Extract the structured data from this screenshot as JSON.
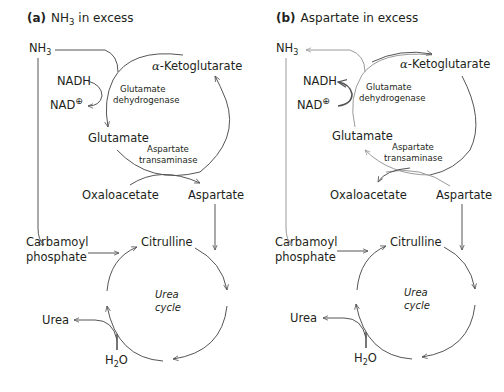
{
  "panels": [
    {
      "id": "a",
      "label": "(a)",
      "title": "NH",
      "title_sub": "3",
      "title_rest": " in excess",
      "nodes": {
        "nh3": "NH",
        "nh3_sub": "3",
        "nadh": "NADH",
        "nad": "NAD",
        "nad_sup": "⊕",
        "alpha": "α",
        "ketoglutarate": "-Ketoglutarate",
        "glutamate": "Glutamate",
        "enzyme1_line1": "Glutamate",
        "enzyme1_line2": "dehydrogenase",
        "enzyme2_line1": "Aspartate",
        "enzyme2_line2": "transaminase",
        "oxaloacetate": "Oxaloacetate",
        "aspartate": "Aspartate",
        "carbamoyl_line1": "Carbamoyl",
        "carbamoyl_line2": "phosphate",
        "citrulline": "Citrulline",
        "cycle_line1": "Urea",
        "cycle_line2": "cycle",
        "urea": "Urea",
        "h2o_h": "H",
        "h2o_sub": "2",
        "h2o_o": "O"
      }
    },
    {
      "id": "b",
      "label": "(b)",
      "title": "Aspartate in excess",
      "nodes": {
        "nh3": "NH",
        "nh3_sub": "3",
        "nadh": "NADH",
        "nad": "NAD",
        "nad_sup": "⊕",
        "alpha": "α",
        "ketoglutarate": "-Ketoglutarate",
        "glutamate": "Glutamate",
        "enzyme1_line1": "Glutamate",
        "enzyme1_line2": "dehydrogenase",
        "enzyme2_line1": "Aspartate",
        "enzyme2_line2": "transaminase",
        "oxaloacetate": "Oxaloacetate",
        "aspartate": "Aspartate",
        "carbamoyl_line1": "Carbamoyl",
        "carbamoyl_line2": "phosphate",
        "citrulline": "Citrulline",
        "cycle_line1": "Urea",
        "cycle_line2": "cycle",
        "urea": "Urea",
        "h2o_h": "H",
        "h2o_sub": "2",
        "h2o_o": "O"
      }
    }
  ]
}
